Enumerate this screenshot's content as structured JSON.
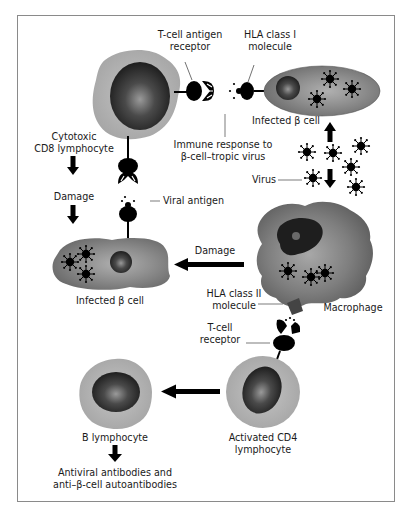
{
  "figure": {
    "title": "",
    "colors": {
      "frame": "#8a8a8a",
      "cell_light": "#b5b5b5",
      "cell_mid": "#8c8c8c",
      "cell_dark": "#6e6e6e",
      "nucleus": "#2a2a2a",
      "ink": "#000000",
      "text": "#1a1a1a"
    }
  },
  "labels": {
    "tcell_antigen_receptor": [
      "T-cell antigen",
      "receptor"
    ],
    "hla_class1": [
      "HLA class I",
      "molecule"
    ],
    "infected_beta_cell_top": "Infected β cell",
    "immune_response": [
      "Immune response to",
      "β-cell–tropic virus"
    ],
    "cytotoxic_cd8": [
      "Cytotoxic",
      "CD8 lymphocyte"
    ],
    "damage_left": "Damage",
    "viral_antigen": "Viral antigen",
    "virus": "Virus",
    "damage_middle": "Damage",
    "infected_beta_cell_left": "Infected β cell",
    "hla_class2": [
      "HLA class II",
      "molecule"
    ],
    "macrophage": "Macrophage",
    "tcell_receptor": [
      "T-cell",
      "receptor"
    ],
    "b_lymphocyte": "B lymphocyte",
    "activated_cd4": [
      "Activated CD4",
      "lymphocyte"
    ],
    "antibodies": [
      "Antiviral antibodies and",
      "anti–β-cell autoantibodies"
    ]
  },
  "nodes": [
    {
      "id": "cd8-lymphocyte",
      "label": "Cytotoxic CD8 lymphocyte"
    },
    {
      "id": "infected-beta-cell-top",
      "label": "Infected β cell"
    },
    {
      "id": "virus",
      "label": "Virus"
    },
    {
      "id": "macrophage",
      "label": "Macrophage"
    },
    {
      "id": "infected-beta-cell-left",
      "label": "Infected β cell"
    },
    {
      "id": "activated-cd4",
      "label": "Activated CD4 lymphocyte"
    },
    {
      "id": "b-lymphocyte",
      "label": "B lymphocyte"
    },
    {
      "id": "antibodies",
      "label": "Antiviral antibodies and anti–β-cell autoantibodies"
    }
  ],
  "edges": [
    {
      "from": "virus",
      "to": "infected-beta-cell-top",
      "label": ""
    },
    {
      "from": "virus",
      "to": "macrophage",
      "label": ""
    },
    {
      "from": "cd8-lymphocyte",
      "to": "infected-beta-cell-left",
      "label": "Damage"
    },
    {
      "from": "macrophage",
      "to": "infected-beta-cell-left",
      "label": "Damage"
    },
    {
      "from": "activated-cd4",
      "to": "b-lymphocyte",
      "label": ""
    },
    {
      "from": "b-lymphocyte",
      "to": "antibodies",
      "label": ""
    }
  ]
}
